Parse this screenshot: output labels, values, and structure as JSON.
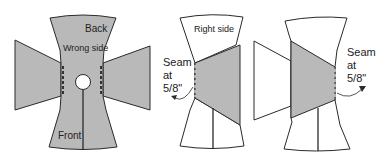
{
  "figure": {
    "colors": {
      "fabric_wrong_side": "#b9b9b9",
      "fabric_right_side": "#ffffff",
      "outline": "#2a2a2a",
      "background": "#ffffff"
    },
    "panel_1": {
      "labels": {
        "back": "Back",
        "wrong_side": "Wrong side",
        "front": "Front"
      }
    },
    "panel_2": {
      "labels": {
        "right_side": "Right side",
        "seam": "Seam\nat\n5/8\""
      }
    },
    "panel_3": {
      "labels": {
        "seam": "Seam\nat\n5/8\""
      }
    }
  }
}
